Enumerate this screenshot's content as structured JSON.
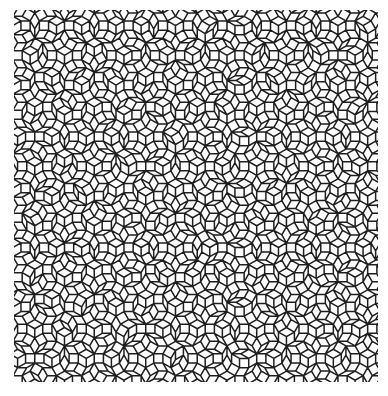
{
  "figure": {
    "canvas": {
      "width": 388,
      "height": 396,
      "background": "#ffffff"
    },
    "pattern_bounds": {
      "x": 14,
      "y": 10,
      "width": 364,
      "height": 372
    },
    "stroke_color": "#1e1e1e",
    "stroke_width": 1.5,
    "edge_length": 9.2,
    "symmetry": 12,
    "grid_families": 6,
    "tile_types": [
      "square",
      "hexagon",
      "thin-rhombus"
    ]
  }
}
